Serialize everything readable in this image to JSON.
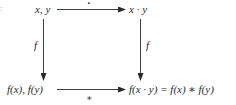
{
  "diagram": {
    "type": "commutative-diagram",
    "edge_mark": ":",
    "nodes": {
      "top_left": "x, y",
      "top_right": "x · y",
      "bottom_left": "f(x), f(y)",
      "bottom_right": "f(x · y) = f(x) ∗ f(y)"
    },
    "edges": {
      "top": {
        "from": "x, y",
        "to": "x · y",
        "label": "·"
      },
      "left": {
        "from": "x, y",
        "to": "f(x), f(y)",
        "label": "f"
      },
      "right": {
        "from": "x · y",
        "to": "f(x · y) = f(x) ∗ f(y)",
        "label": "f"
      },
      "bottom": {
        "from": "f(x), f(y)",
        "to": "f(x · y) = f(x) ∗ f(y)",
        "label": "∗"
      }
    },
    "colors": {
      "ink": "#2a2a2a",
      "background": "#ffffff"
    }
  }
}
